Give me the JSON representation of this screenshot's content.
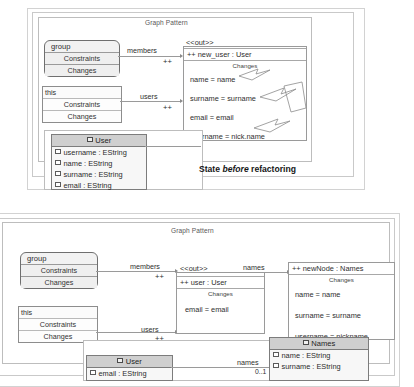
{
  "figure": {
    "caption_before": "State before refactoring",
    "caption_before_parts": {
      "pre": "State ",
      "em": "before",
      "post": " refactoring"
    },
    "frame_label": "Graph Pattern"
  },
  "top_diagram": {
    "frame_label": "Graph Pattern",
    "group_node": {
      "title": "group",
      "constraints": "Constraints",
      "changes": "Changes"
    },
    "this_node": {
      "title": "this",
      "constraints": "Constraints",
      "changes": "Changes"
    },
    "edges": [
      {
        "label": "members",
        "plus": "++"
      },
      {
        "label": "users",
        "plus": "++"
      }
    ],
    "out_node": {
      "stereotype": "<<out>>",
      "name": "++ new_user : User",
      "changes_label": "Changes",
      "assignments": [
        "name = name",
        "surname = surname",
        "email = email",
        "username = nick.name"
      ]
    },
    "user_class": {
      "name": "User",
      "attributes": [
        "username : EString",
        "name : EString",
        "surname : EString",
        "email : EString"
      ]
    }
  },
  "bottom_diagram": {
    "frame_label": "Graph Pattern",
    "group_node": {
      "title": "group",
      "constraints": "Constraints",
      "changes": "Changes"
    },
    "this_node": {
      "title": "this",
      "constraints": "Constraints",
      "changes": "Changes"
    },
    "edges": [
      {
        "label": "members",
        "plus": "++"
      },
      {
        "label": "users",
        "plus": "++"
      },
      {
        "label": "names",
        "plus": "++"
      }
    ],
    "out_node": {
      "stereotype": "<<out>>",
      "name": "++ user : User",
      "changes_label": "Changes",
      "assignments": [
        "email = email"
      ]
    },
    "new_node": {
      "name": "++ newNode : Names",
      "changes_label": "Changes",
      "assignments": [
        "name = name",
        "surname = surname",
        "username = nickname"
      ]
    },
    "user_class": {
      "name": "User",
      "attributes": [
        "email : EString"
      ]
    },
    "names_class": {
      "name": "Names",
      "attributes": [
        "name : EString",
        "surname : EString"
      ]
    },
    "association": {
      "label": "names",
      "multiplicity": "0..1"
    }
  }
}
